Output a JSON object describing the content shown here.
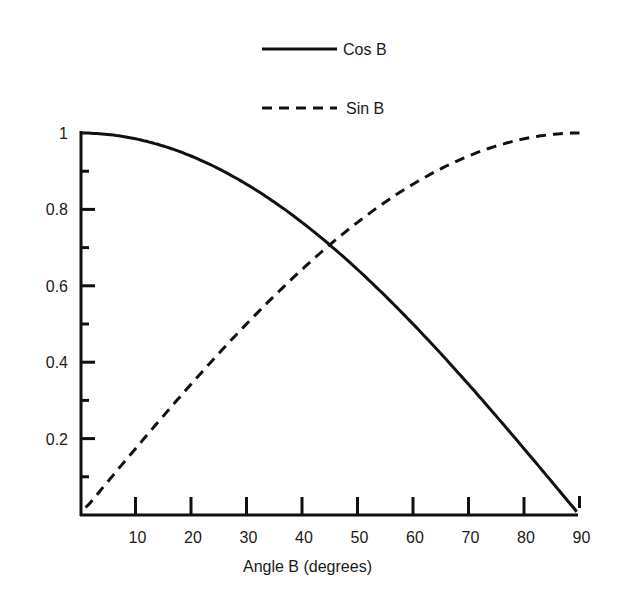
{
  "chart_data": {
    "type": "line",
    "title": "",
    "xlabel": "Angle B (degrees)",
    "ylabel": "",
    "xlim": [
      0,
      90
    ],
    "ylim": [
      0,
      1
    ],
    "grid": false,
    "legend_position": "top-center",
    "x_ticks": [
      "10",
      "20",
      "30",
      "40",
      "50",
      "60",
      "70",
      "80",
      "90"
    ],
    "y_ticks": [
      "0.2",
      "0.4",
      "0.6",
      "0.8",
      "1"
    ],
    "x": [
      0,
      10,
      20,
      30,
      40,
      45,
      50,
      60,
      70,
      80,
      90
    ],
    "series": [
      {
        "name": "Cos B",
        "style": "solid",
        "values": [
          1.0,
          0.985,
          0.94,
          0.866,
          0.766,
          0.707,
          0.643,
          0.5,
          0.342,
          0.174,
          0.03
        ]
      },
      {
        "name": "Sin B",
        "style": "dashed",
        "values": [
          0.02,
          0.174,
          0.342,
          0.5,
          0.643,
          0.707,
          0.766,
          0.866,
          0.94,
          0.985,
          1.0
        ]
      }
    ]
  },
  "legend": {
    "cos_label": "Cos B",
    "sin_label": "Sin B"
  },
  "axes": {
    "xlabel": "Angle B (degrees)",
    "x_tick_labels": [
      "10",
      "20",
      "30",
      "40",
      "50",
      "60",
      "70",
      "80",
      "90"
    ],
    "y_tick_labels": [
      "0.2",
      "0.4",
      "0.6",
      "0.8",
      "1"
    ]
  }
}
